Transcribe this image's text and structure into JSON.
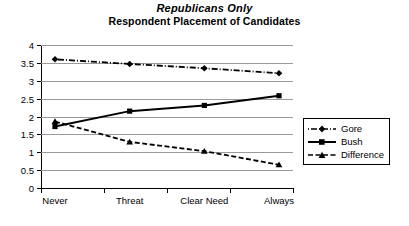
{
  "chart_data": {
    "type": "line",
    "title": "Republicans Only",
    "subtitle": "Respondent Placement of Candidates",
    "xlabel": "",
    "ylabel": "",
    "categories": [
      "Never",
      "Threat",
      "Clear Need",
      "Always"
    ],
    "ylim": [
      0,
      4
    ],
    "yticks": [
      "0",
      "0.5",
      "1",
      "1.5",
      "2",
      "2.5",
      "3",
      "3.5",
      "4"
    ],
    "ytick_values": [
      0,
      0.5,
      1,
      1.5,
      2,
      2.5,
      3,
      3.5,
      4
    ],
    "grid": true,
    "legend_position": "right",
    "series": [
      {
        "name": "Gore",
        "values": [
          3.6,
          3.47,
          3.35,
          3.21
        ],
        "line_style": "dash-dot",
        "marker": "diamond",
        "color": "#000000"
      },
      {
        "name": "Bush",
        "values": [
          1.72,
          2.15,
          2.31,
          2.58
        ],
        "line_style": "solid",
        "marker": "square",
        "color": "#000000"
      },
      {
        "name": "Difference",
        "values": [
          1.86,
          1.29,
          1.03,
          0.65
        ],
        "line_style": "dashed",
        "marker": "triangle",
        "color": "#000000"
      }
    ]
  },
  "legend": {
    "entries": [
      {
        "label": "Gore"
      },
      {
        "label": "Bush"
      },
      {
        "label": "Difference"
      }
    ]
  },
  "colors": {
    "ink": "#000000",
    "gridline": "#9a9a9a",
    "background": "#ffffff"
  }
}
